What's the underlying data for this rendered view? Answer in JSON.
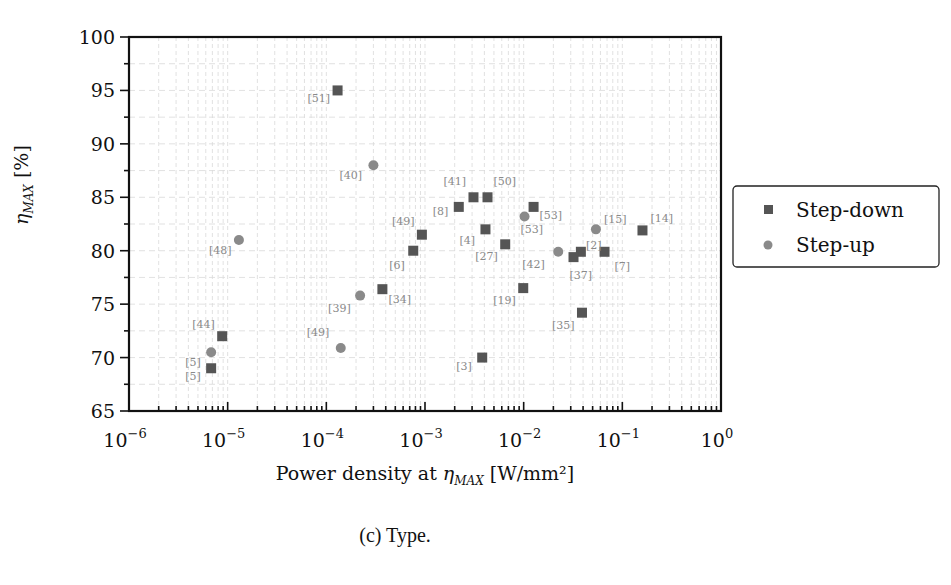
{
  "chart_data": {
    "type": "scatter",
    "title": "",
    "xlabel": "Power density at η_MAX [W/mm²]",
    "ylabel": "η_MAX [%]",
    "xscale": "log",
    "xlim": [
      1e-06,
      1
    ],
    "ylim": [
      65,
      100
    ],
    "grid": true,
    "legend_position": "right outside",
    "x_tick_labels": [
      "10^-6",
      "10^-5",
      "10^-4",
      "10^-3",
      "10^-2",
      "10^-1",
      "10^0"
    ],
    "y_tick_labels": [
      "65",
      "70",
      "75",
      "80",
      "85",
      "90",
      "95",
      "100"
    ],
    "series": [
      {
        "name": "Step-down",
        "marker": "square",
        "color": "#555555",
        "points": [
          {
            "x": 0.00013,
            "y": 95.0,
            "label": "[51]"
          },
          {
            "x": 0.0031,
            "y": 85.0,
            "label": "[41]"
          },
          {
            "x": 0.0043,
            "y": 85.0,
            "label": "[50]"
          },
          {
            "x": 0.0022,
            "y": 84.1,
            "label": "[8]"
          },
          {
            "x": 0.0126,
            "y": 84.1,
            "label": "[53]"
          },
          {
            "x": 0.0041,
            "y": 82.0,
            "label": "[4]"
          },
          {
            "x": 0.16,
            "y": 81.9,
            "label": "[14]"
          },
          {
            "x": 0.00093,
            "y": 81.5,
            "label": "[49]"
          },
          {
            "x": 0.0065,
            "y": 80.6,
            "label": "[27]"
          },
          {
            "x": 0.00076,
            "y": 80.0,
            "label": "[6]"
          },
          {
            "x": 0.038,
            "y": 79.9,
            "label": ""
          },
          {
            "x": 0.032,
            "y": 79.4,
            "label": "[37]"
          },
          {
            "x": 0.066,
            "y": 79.9,
            "label": "[7]"
          },
          {
            "x": 0.0099,
            "y": 76.5,
            "label": "[19]"
          },
          {
            "x": 0.00037,
            "y": 76.4,
            "label": "[34]"
          },
          {
            "x": 0.039,
            "y": 74.2,
            "label": "[35]"
          },
          {
            "x": 8.8e-06,
            "y": 72.0,
            "label": "[44]"
          },
          {
            "x": 0.0038,
            "y": 70.0,
            "label": "[3]"
          },
          {
            "x": 6.8e-06,
            "y": 69.0,
            "label": "[5]"
          }
        ]
      },
      {
        "name": "Step-up",
        "marker": "circle",
        "color": "#8a8a8a",
        "points": [
          {
            "x": 0.0003,
            "y": 88.0,
            "label": "[40]"
          },
          {
            "x": 0.0102,
            "y": 83.2,
            "label": "[53]"
          },
          {
            "x": 0.054,
            "y": 82.0,
            "label": "[15]"
          },
          {
            "x": 1.3e-05,
            "y": 81.0,
            "label": "[48]"
          },
          {
            "x": 0.0224,
            "y": 79.9,
            "label": "[42]"
          },
          {
            "x": 0.00022,
            "y": 75.8,
            "label": "[39]"
          },
          {
            "x": 0.00014,
            "y": 70.9,
            "label": "[49]"
          },
          {
            "x": 6.8e-06,
            "y": 70.5,
            "label": "[5]"
          }
        ]
      }
    ],
    "extra_annotations": [
      {
        "text": "[2]",
        "near": "point x=0.054 y=82"
      }
    ]
  },
  "legend": {
    "items": [
      {
        "label": "Step-down",
        "marker": "square"
      },
      {
        "label": "Step-up",
        "marker": "circle"
      }
    ]
  },
  "axes": {
    "x_title_prefix": "Power density at ",
    "x_title_sym": "η",
    "x_title_sub": "MAX",
    "x_title_suffix": " [W/mm²]",
    "y_title_sym": "η",
    "y_title_sub": "MAX",
    "y_title_suffix": "  [%]"
  },
  "caption": "(c) Type."
}
